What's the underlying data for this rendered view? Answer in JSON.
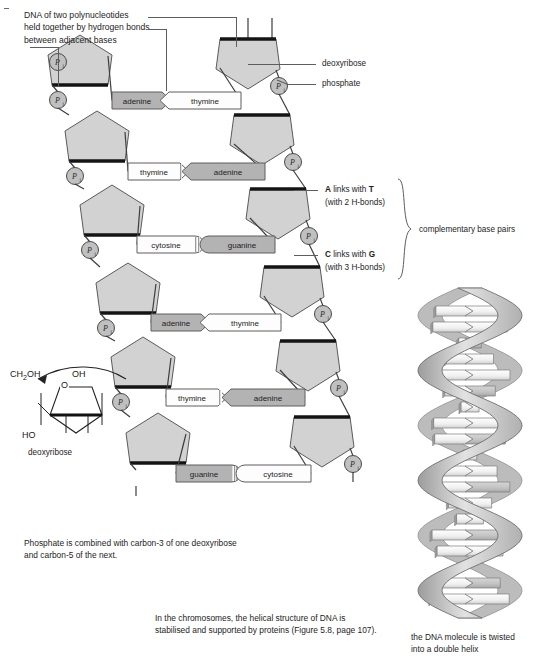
{
  "figure": {
    "tick_mark": ""
  },
  "annotations": {
    "top_left_note": "DNA of two polynucleotides\nheld together by hydrogen bonds\nbetween adjacent bases",
    "deoxyribose_label": "deoxyribose",
    "phosphate_label": "phosphate",
    "at_pair_line1_a": "A",
    "at_pair_line1_mid": " links with ",
    "at_pair_line1_b": "T",
    "at_pair_line2": "(with 2 H-bonds)",
    "cg_pair_line1_a": "C",
    "cg_pair_line1_mid": " links with ",
    "cg_pair_line1_b": "G",
    "cg_pair_line2": "(with 3 H-bonds)",
    "brace_label": "complementary base pairs",
    "phosphate_note": "Phosphate is combined with carbon-3 of one deoxyribose\nand carbon-5 of the next.",
    "chromosome_note": "In the chromosomes, the helical structure of DNA is\nstabilised and supported by proteins (Figure 5.8, page 107).",
    "helix_caption": "the DNA molecule is twisted\ninto a double helix"
  },
  "molecule": {
    "name": "deoxyribose",
    "atoms": {
      "ch2oh": "CH2OH",
      "ch2oh_main": "CH",
      "ch2oh_sub": "2",
      "ch2oh_tail": "OH",
      "oh_right": "OH",
      "o_ring": "O",
      "ho_bottom": "HO"
    }
  },
  "phosphate_symbol": {
    "letter": "P",
    "subscript": "i"
  },
  "base_pairs": [
    {
      "left": "adenine",
      "right": "thymine",
      "left_shade": "dark",
      "right_shade": "light",
      "joint": "angular",
      "row_y": 92,
      "left_x": 112,
      "right_x": 160,
      "rung_left_w": 50,
      "rung_right_w": 72
    },
    {
      "left": "thymine",
      "right": "adenine",
      "left_shade": "light",
      "right_shade": "dark",
      "joint": "angular",
      "row_y": 163,
      "left_x": 128,
      "right_x": 182,
      "rung_left_w": 52,
      "rung_right_w": 74
    },
    {
      "left": "cytosine",
      "right": "guanine",
      "left_shade": "light",
      "right_shade": "dark",
      "joint": "round",
      "row_y": 236,
      "left_x": 137,
      "right_x": 200,
      "rung_left_w": 58,
      "rung_right_w": 66
    },
    {
      "left": "adenine",
      "right": "thymine",
      "left_shade": "dark",
      "right_shade": "light",
      "joint": "angular",
      "row_y": 314,
      "left_x": 151,
      "right_x": 200,
      "rung_left_w": 50,
      "rung_right_w": 72
    },
    {
      "left": "thymine",
      "right": "adenine",
      "left_shade": "light",
      "right_shade": "dark",
      "joint": "angular",
      "row_y": 389,
      "left_x": 166,
      "right_x": 222,
      "rung_left_w": 52,
      "rung_right_w": 74
    },
    {
      "left": "guanine",
      "right": "cytosine",
      "left_shade": "dark",
      "right_shade": "light",
      "joint": "round",
      "row_y": 465,
      "left_x": 176,
      "right_x": 236,
      "rung_left_w": 56,
      "rung_right_w": 66
    }
  ],
  "colors": {
    "base_dark": "#b3b3b3",
    "base_light": "#fdfdfd",
    "sugar_fill": "#d2d2d2",
    "sugar_edge": "#141414",
    "phosphate_fill": "#c0c0c0",
    "line": "#4f4f4f",
    "text": "#1d1d1d",
    "helix_ribbon": "#c4c4c4",
    "helix_rung": "#ededed"
  }
}
